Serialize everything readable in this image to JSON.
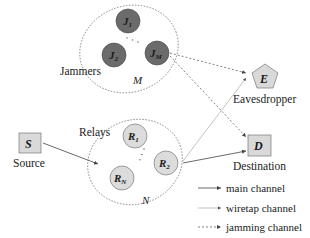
{
  "diagram": {
    "groups": {
      "jammers": {
        "label": "Jammers",
        "count_label": "M",
        "nodes": [
          {
            "base": "J",
            "sub": "1"
          },
          {
            "base": "J",
            "sub": "2"
          },
          {
            "base": "J",
            "sub": "M"
          }
        ],
        "ellipsis": "· · ·"
      },
      "relays": {
        "label": "Relays",
        "count_label": "N",
        "nodes": [
          {
            "base": "R",
            "sub": "1"
          },
          {
            "base": "R",
            "sub": "2"
          },
          {
            "base": "R",
            "sub": "N"
          }
        ],
        "ellipsis": "· · ·"
      }
    },
    "source": {
      "symbol": "S",
      "label": "Source"
    },
    "destination": {
      "symbol": "D",
      "label": "Destination"
    },
    "eavesdropper": {
      "symbol": "E",
      "label": "Eavesdropper"
    },
    "legend": [
      {
        "label": "main channel",
        "style": "solid"
      },
      {
        "label": "wiretap channel",
        "style": "thin"
      },
      {
        "label": "jamming channel",
        "style": "dotted"
      }
    ],
    "colors": {
      "jammer_fill": "#6b6b6b",
      "relay_fill": "#dcdcdc",
      "box_fill": "#d9d9d9",
      "line": "#555555"
    }
  }
}
